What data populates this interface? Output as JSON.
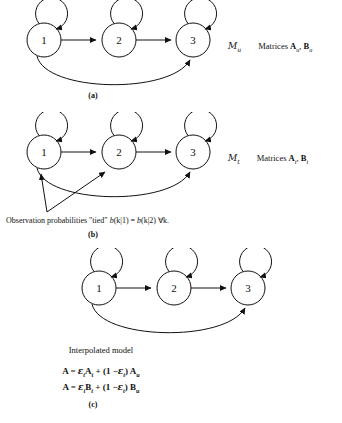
{
  "figure": {
    "panels": [
      {
        "id": "a",
        "caption": "(a)",
        "model_symbol": "M",
        "model_subscript": "u",
        "matrices_label": "Matrices",
        "matrix_1": "A",
        "matrix_1_sub": "u",
        "matrix_sep": ",",
        "matrix_2": "B",
        "matrix_2_sub": "u",
        "states": [
          "1",
          "2",
          "3"
        ],
        "has_pointer_arrows": false
      },
      {
        "id": "b",
        "caption": "(b)",
        "model_symbol": "M",
        "model_subscript": "t",
        "matrices_label": "Matrices",
        "matrix_1": "A",
        "matrix_1_sub": "t",
        "matrix_sep": ",",
        "matrix_2": "B",
        "matrix_2_sub": "t",
        "states": [
          "1",
          "2",
          "3"
        ],
        "has_pointer_arrows": true,
        "note_prefix": "Observation probabilities \"tied\" ",
        "note_b1": "b",
        "note_arg1": "(k|1)",
        "note_eq": " = ",
        "note_b2": "b",
        "note_arg2": "(k|2)",
        "note_suffix": "  ∀k."
      },
      {
        "id": "c",
        "caption": "(c)",
        "states": [
          "1",
          "2",
          "3"
        ],
        "has_pointer_arrows": false,
        "interpolated_title": "Interpolated model",
        "equation_1": "A = εₜ Aₜ + (1 − εₜ) Aᵤ",
        "equation_2": "A = εₜ Bₜ + (1 − εₜ) Bᵤ",
        "eq1": {
          "lhs": "A",
          "eq": "=",
          "eps": "ε",
          "eps_sub": "t",
          "term1": "A",
          "term1_sub": "t",
          "plus": "+",
          "open": "(1 −",
          "eps2": "ε",
          "eps2_sub": "t",
          "close": ")",
          "term2": "A",
          "term2_sub": "u"
        },
        "eq2": {
          "lhs": "A",
          "eq": "=",
          "eps": "ε",
          "eps_sub": "t",
          "term1": "B",
          "term1_sub": "t",
          "plus": "+",
          "open": "(1 −",
          "eps2": "ε",
          "eps2_sub": "t",
          "close": ")",
          "term2": "B",
          "term2_sub": "u"
        }
      }
    ]
  },
  "colors": {
    "ink": "#111111",
    "background": "#ffffff"
  }
}
